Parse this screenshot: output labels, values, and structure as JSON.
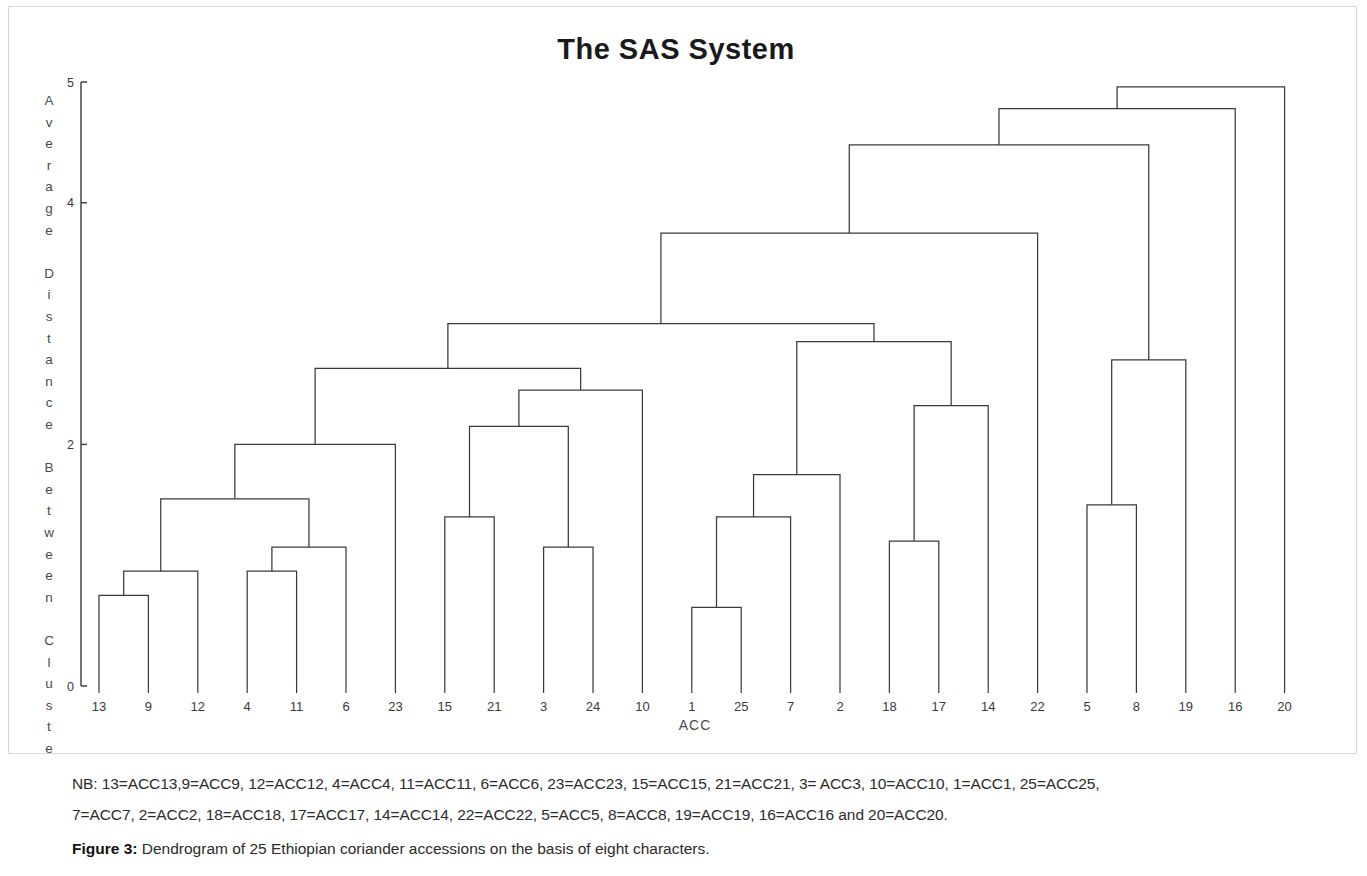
{
  "figure": {
    "title": "The SAS System",
    "x_axis_title": "ACC",
    "y_axis_label": "Average Distance Between Clusters",
    "caption_label": "Figure 3:",
    "caption_text": " Dendrogram of 25 Ethiopian coriander accessions on the basis of eight characters.",
    "note_line_1": "NB: 13=ACC13,9=ACC9, 12=ACC12, 4=ACC4, 11=ACC11, 6=ACC6, 23=ACC23, 15=ACC15, 21=ACC21, 3= ACC3, 10=ACC10, 1=ACC1, 25=ACC25,",
    "note_line_2": "7=ACC7, 2=ACC2, 18=ACC18, 17=ACC17, 14=ACC14, 22=ACC22, 5=ACC5, 8=ACC8, 19=ACC19, 16=ACC16 and 20=ACC20.",
    "line_color": "#3a3a3a",
    "background_color": "#ffffff"
  },
  "chart_data": {
    "type": "line",
    "chart_kind": "dendrogram",
    "title": "The SAS System",
    "xlabel": "ACC",
    "ylabel": "Average Distance Between Clusters",
    "ylim": [
      0,
      5
    ],
    "grid": false,
    "legend": "none",
    "y_ticks": [
      0,
      2,
      4,
      5
    ],
    "y_tick_labels": [
      "0",
      "2",
      "4",
      "5"
    ],
    "leaf_order": [
      "13",
      "9",
      "12",
      "4",
      "11",
      "6",
      "23",
      "15",
      "21",
      "3",
      "24",
      "10",
      "1",
      "25",
      "7",
      "2",
      "18",
      "17",
      "14",
      "22",
      "5",
      "8",
      "19",
      "16",
      "20"
    ],
    "n_leaves": 25,
    "merges": [
      {
        "id": "m1",
        "left": "13",
        "right": "9",
        "height": 0.75,
        "label": "13+9"
      },
      {
        "id": "m2",
        "left": "m1",
        "right": "12",
        "height": 0.95,
        "label": "(13,9)+12"
      },
      {
        "id": "m3",
        "left": "4",
        "right": "11",
        "height": 0.95,
        "label": "4+11"
      },
      {
        "id": "m4",
        "left": "m3",
        "right": "6",
        "height": 1.15,
        "label": "(4,11)+6"
      },
      {
        "id": "m5",
        "left": "m2",
        "right": "m4",
        "height": 1.55,
        "label": "left-pair-join"
      },
      {
        "id": "m6",
        "left": "m5",
        "right": "23",
        "height": 2.0,
        "label": "+23"
      },
      {
        "id": "m7",
        "left": "15",
        "right": "21",
        "height": 1.4,
        "label": "15+21"
      },
      {
        "id": "m8",
        "left": "3",
        "right": "24",
        "height": 1.15,
        "label": "3+24"
      },
      {
        "id": "m9",
        "left": "m7",
        "right": "m8",
        "height": 2.15,
        "label": "(15,21)+(3,24)"
      },
      {
        "id": "m10",
        "left": "m9",
        "right": "10",
        "height": 2.45,
        "label": "+10"
      },
      {
        "id": "m11",
        "left": "m6",
        "right": "m10",
        "height": 2.63,
        "label": "cluster-A"
      },
      {
        "id": "m12",
        "left": "1",
        "right": "25",
        "height": 0.65,
        "label": "1+25"
      },
      {
        "id": "m13",
        "left": "m12",
        "right": "7",
        "height": 1.4,
        "label": "(1,25)+7"
      },
      {
        "id": "m14",
        "left": "m13",
        "right": "2",
        "height": 1.75,
        "label": "+2"
      },
      {
        "id": "m15",
        "left": "18",
        "right": "17",
        "height": 1.2,
        "label": "18+17"
      },
      {
        "id": "m16",
        "left": "m15",
        "right": "14",
        "height": 2.32,
        "label": "(18,17)+14"
      },
      {
        "id": "m17",
        "left": "m14",
        "right": "m16",
        "height": 2.85,
        "label": "cluster-B"
      },
      {
        "id": "m18",
        "left": "m11",
        "right": "m17",
        "height": 3.0,
        "label": "cluster-AB"
      },
      {
        "id": "m19",
        "left": "m18",
        "right": "22",
        "height": 3.75,
        "label": "+22"
      },
      {
        "id": "m20",
        "left": "5",
        "right": "8",
        "height": 1.5,
        "label": "5+8"
      },
      {
        "id": "m21",
        "left": "m20",
        "right": "19",
        "height": 2.7,
        "label": "(5,8)+19"
      },
      {
        "id": "m22",
        "left": "m19",
        "right": "m21",
        "height": 4.48,
        "label": "cluster-C"
      },
      {
        "id": "m23",
        "left": "m22",
        "right": "16",
        "height": 4.78,
        "label": "+16"
      },
      {
        "id": "m24",
        "left": "m23",
        "right": "20",
        "height": 4.96,
        "label": "root"
      }
    ]
  }
}
